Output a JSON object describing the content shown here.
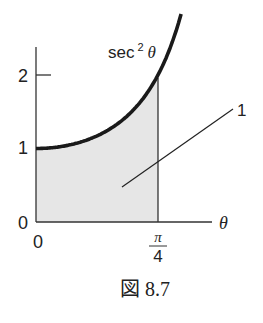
{
  "figure": {
    "caption": "図 8.7",
    "curve_label": "sec",
    "curve_label_exp": "2",
    "curve_label_var": "θ",
    "region_label": "1",
    "x_axis_label": "θ",
    "y_ticks": [
      {
        "value": 0,
        "label": "0"
      },
      {
        "value": 1,
        "label": "1"
      },
      {
        "value": 2,
        "label": "2"
      }
    ],
    "x_ticks": [
      {
        "value": 0,
        "label": "0"
      },
      {
        "value": 0.7854,
        "label_num": "π",
        "label_den": "4"
      }
    ],
    "colors": {
      "curve": "#1a1a1a",
      "axis": "#333333",
      "shade": "#e6e6e6",
      "text": "#222222"
    }
  },
  "chart_data": {
    "type": "area",
    "title": "",
    "function": "sec^2(θ)",
    "xlabel": "θ",
    "ylabel": "",
    "x": [
      0,
      0.1963,
      0.3927,
      0.589,
      0.7854,
      0.8836,
      0.9425
    ],
    "series": [
      {
        "name": "sec²θ",
        "values": [
          1.0,
          1.04,
          1.17,
          1.45,
          2.0,
          2.5,
          2.9
        ]
      }
    ],
    "shaded_region": {
      "from": 0,
      "to": 0.7854,
      "area": 1,
      "label": "1"
    },
    "xlim": [
      0,
      1.1
    ],
    "ylim": [
      0,
      2.4
    ],
    "x_tick_labels": [
      "0",
      "π/4"
    ],
    "y_tick_labels": [
      "0",
      "1",
      "2"
    ],
    "grid": false,
    "legend": "none"
  }
}
